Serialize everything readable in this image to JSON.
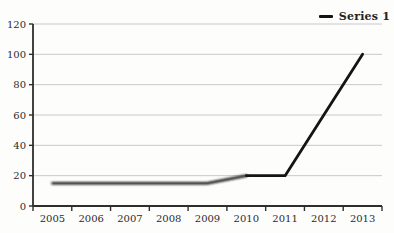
{
  "chart": {
    "legend": {
      "series_label": "Series 1"
    }
  },
  "chart_data": {
    "type": "line",
    "categories": [
      "2005",
      "2006",
      "2007",
      "2008",
      "2009",
      "2010",
      "2011",
      "2012",
      "2013"
    ],
    "series": [
      {
        "name": "Series 1",
        "values": [
          15,
          15,
          15,
          15,
          15,
          20,
          20,
          60,
          100
        ]
      }
    ],
    "title": "",
    "xlabel": "",
    "ylabel": "",
    "ylim": [
      0,
      120
    ],
    "ytick_step": 20,
    "grid": true,
    "legend_position": "top-right",
    "colors": {
      "line": "#141414",
      "grid": "#c9c9c9",
      "axis": "#2e2e2e",
      "text": "#2b2b2b",
      "background": "#fdfdfc"
    }
  }
}
